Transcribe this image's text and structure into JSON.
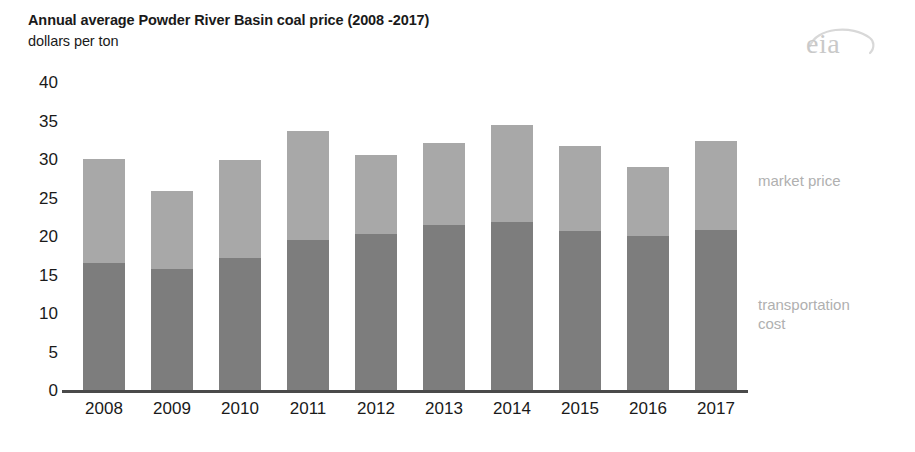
{
  "header": {
    "title": "Annual average Powder River Basin coal price (2008 -2017)",
    "subtitle": "dollars per ton",
    "logo_text": "eia",
    "logo_name": "eia-logo"
  },
  "legend": {
    "market_price": "market price",
    "transportation_cost": "transportation\ncost"
  },
  "colors": {
    "market_price": "#a8a8a8",
    "transportation_cost": "#7d7d7d",
    "axis": "#4a4a4a",
    "text": "#1a1a1a",
    "legend_text": "#b0b0b0",
    "logo": "#c9c9c9",
    "background": "#ffffff"
  },
  "chart_data": {
    "type": "bar",
    "title": "Annual average Powder River Basin coal price (2008 -2017)",
    "subtitle": "dollars per ton",
    "xlabel": "",
    "ylabel": "dollars per ton",
    "ylim": [
      0,
      40
    ],
    "yticks": [
      0,
      5,
      10,
      15,
      20,
      25,
      30,
      35,
      40
    ],
    "ytick_labels": [
      "0",
      "5",
      "10",
      "15",
      "20",
      "25",
      "30",
      "35",
      "40"
    ],
    "grid": false,
    "stacked": true,
    "legend_position": "right",
    "categories": [
      "2008",
      "2009",
      "2010",
      "2011",
      "2012",
      "2013",
      "2014",
      "2015",
      "2016",
      "2017"
    ],
    "series": [
      {
        "name": "transportation cost",
        "color": "#7d7d7d",
        "values": [
          16.5,
          15.7,
          17.2,
          19.5,
          20.2,
          21.4,
          21.8,
          20.6,
          20.0,
          20.8
        ]
      },
      {
        "name": "market price",
        "color": "#a8a8a8",
        "values": [
          13.5,
          10.1,
          12.7,
          14.1,
          10.3,
          10.7,
          12.6,
          11.1,
          9.0,
          11.6
        ]
      }
    ],
    "totals": [
      30.0,
      25.8,
      29.9,
      33.6,
      30.5,
      32.1,
      34.4,
      31.7,
      29.0,
      32.4
    ]
  },
  "geometry": {
    "baseline_y": 390,
    "top_value_y": 82,
    "y_max": 40,
    "bar_left_start": 83,
    "bar_width": 42,
    "bar_pitch": 68,
    "axis_line_left": 62,
    "axis_line_width": 686,
    "y_label_x": 14,
    "x_label_y": 400
  }
}
